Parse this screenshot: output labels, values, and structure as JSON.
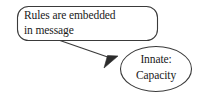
{
  "diagram": {
    "type": "flowchart",
    "background_color": "#ffffff",
    "stroke_color": "#3a3a3a",
    "text_color": "#1a1a1a",
    "nodes": [
      {
        "id": "rules-box",
        "shape": "rounded-rectangle",
        "lines": [
          "Rules are embedded",
          "in message"
        ],
        "line1": "Rules are embedded",
        "line2": "in message",
        "x": 17,
        "y": 6,
        "width": 141,
        "height": 35,
        "corner_radius": 11
      },
      {
        "id": "innate-capacity-oval",
        "shape": "ellipse",
        "lines": [
          "Innate:",
          "Capacity"
        ],
        "line1": "Innate:",
        "line2": "Capacity",
        "center_x": 156,
        "center_y": 69,
        "radius_x": 36,
        "radius_y": 23
      }
    ],
    "edges": [
      {
        "id": "rules-to-innate",
        "from": "rules-box",
        "to": "innate-capacity-oval",
        "style": "solid",
        "arrowhead": "filled-triangle",
        "start_x": 60,
        "start_y": 41,
        "end_x": 116,
        "end_y": 60
      }
    ]
  }
}
